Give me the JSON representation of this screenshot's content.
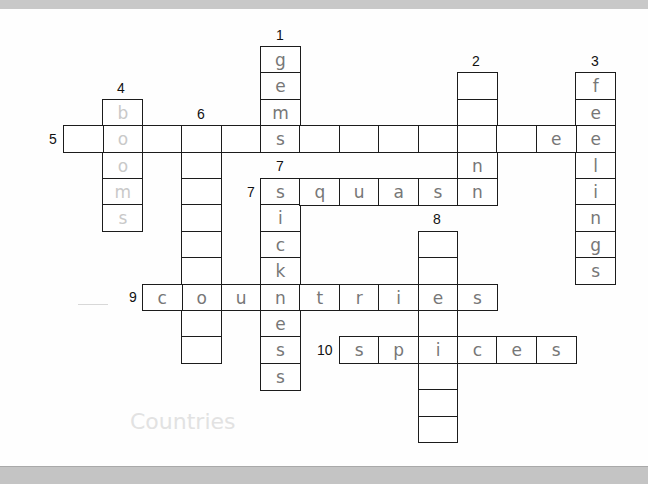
{
  "puzzle": {
    "cell_w": 39.4,
    "cell_h": 26.4,
    "origin_x": 63,
    "origin_y": 46,
    "entries": [
      {
        "id": "1-down",
        "number": "1",
        "dir": "down",
        "col": 5,
        "row": 0,
        "answer": [
          "g",
          "e",
          "m",
          "s"
        ],
        "faint": false
      },
      {
        "id": "2-down",
        "number": "2",
        "dir": "down",
        "col": 10,
        "row": 1,
        "answer": [
          "",
          "",
          "",
          "n"
        ],
        "faint": false
      },
      {
        "id": "3-down",
        "number": "3",
        "dir": "down",
        "col": 13,
        "row": 1,
        "answer": [
          "f",
          "e",
          "e",
          "l",
          "i",
          "n",
          "g",
          "s"
        ],
        "faint": false
      },
      {
        "id": "4-down",
        "number": "4",
        "dir": "down",
        "col": 1,
        "row": 2,
        "answer": [
          "b",
          "o",
          "o",
          "m",
          "s"
        ],
        "faint": true
      },
      {
        "id": "5-across",
        "number": "5",
        "dir": "across",
        "col": 0,
        "row": 3,
        "answer": [
          "",
          "o",
          "",
          "",
          "",
          "s",
          "",
          "",
          "",
          "",
          "",
          "",
          "e"
        ],
        "faint": false
      },
      {
        "id": "6-down",
        "number": "6",
        "dir": "down",
        "col": 3,
        "row": 3,
        "answer": [
          "",
          "",
          "",
          "",
          "",
          "",
          "o",
          "",
          ""
        ],
        "faint": false
      },
      {
        "id": "7-down",
        "number": "7",
        "dir": "down",
        "col": 5,
        "row": 5,
        "answer": [
          "s",
          "i",
          "c",
          "k",
          "n",
          "e",
          "s",
          "s"
        ],
        "faint": false
      },
      {
        "id": "7-across",
        "number": "7",
        "dir": "across",
        "col": 5,
        "row": 5,
        "answer": [
          "s",
          "q",
          "u",
          "a",
          "s",
          "n"
        ],
        "faint": false
      },
      {
        "id": "8-down",
        "number": "8",
        "dir": "down",
        "col": 9,
        "row": 7,
        "answer": [
          "",
          "",
          "e",
          "",
          "i",
          "",
          "",
          ""
        ],
        "faint": false
      },
      {
        "id": "9-across",
        "number": "9",
        "dir": "across",
        "col": 2,
        "row": 9,
        "answer": [
          "c",
          "o",
          "u",
          "n",
          "t",
          "r",
          "i",
          "e",
          "s"
        ],
        "faint": false
      },
      {
        "id": "10-across",
        "number": "10",
        "dir": "across",
        "col": 7,
        "row": 11,
        "answer": [
          "s",
          "p",
          "i",
          "c",
          "e",
          "s"
        ],
        "faint": false
      }
    ]
  },
  "numbers": [
    {
      "label": "1",
      "x": 276,
      "y": 27
    },
    {
      "label": "2",
      "x": 472,
      "y": 53
    },
    {
      "label": "3",
      "x": 591,
      "y": 53
    },
    {
      "label": "4",
      "x": 117,
      "y": 80
    },
    {
      "label": "6",
      "x": 197,
      "y": 106
    },
    {
      "label": "5",
      "x": 49,
      "y": 131
    },
    {
      "label": "7",
      "x": 276,
      "y": 158
    },
    {
      "label": "7",
      "x": 247,
      "y": 184
    },
    {
      "label": "8",
      "x": 433,
      "y": 211
    },
    {
      "label": "9",
      "x": 129,
      "y": 289
    },
    {
      "label": "10",
      "x": 317,
      "y": 342
    }
  ],
  "ghost_text": "Countries"
}
